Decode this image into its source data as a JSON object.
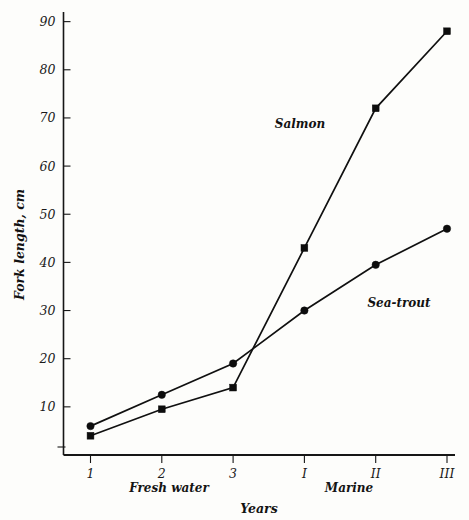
{
  "chart_data": {
    "type": "line",
    "title": "",
    "subtitle": "",
    "xlabel": "Years",
    "ylabel": "Fork length, cm",
    "categories": [
      "1",
      "2",
      "3",
      "I",
      "II",
      "III"
    ],
    "x_tick_labels": [
      "1",
      "2",
      "3",
      "I",
      "II",
      "III"
    ],
    "y_tick_labels": [
      "10",
      "20",
      "30",
      "40",
      "50",
      "60",
      "70",
      "80",
      "90"
    ],
    "y_ticks": [
      10,
      20,
      30,
      40,
      50,
      60,
      70,
      80,
      90
    ],
    "ylim": [
      0,
      92
    ],
    "xlim": [
      0.5,
      6.5
    ],
    "grid": false,
    "legend_position": "inline-annotations",
    "x_group_labels": [
      {
        "label": "Fresh water",
        "categories": [
          "1",
          "2",
          "3"
        ]
      },
      {
        "label": "Marine",
        "categories": [
          "I",
          "II",
          "III"
        ]
      }
    ],
    "series": [
      {
        "name": "Salmon",
        "marker": "square",
        "values": [
          4,
          9.5,
          14,
          43,
          72,
          88
        ],
        "color": "#0d0d0d"
      },
      {
        "name": "Sea-trout",
        "marker": "circle",
        "values": [
          6,
          12.5,
          19,
          30,
          39.5,
          47
        ],
        "color": "#0d0d0d"
      }
    ],
    "annotations": [
      {
        "text": "Salmon",
        "x_category": "I",
        "y_value": 63
      },
      {
        "text": "Sea-trout",
        "x_category": "II",
        "y_value": 31
      }
    ]
  },
  "axes": {
    "y_axis_title": "Fork length, cm",
    "x_axis_title": "Years"
  },
  "labels": {
    "fresh_water": "Fresh water",
    "marine": "Marine",
    "salmon": "Salmon",
    "sea_trout": "Sea-trout"
  },
  "colors": {
    "ink": "#0d0d0d",
    "background": "#fdfdfb",
    "axis": "#161616"
  }
}
